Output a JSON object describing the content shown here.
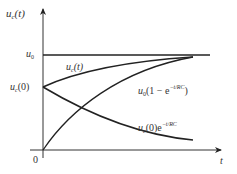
{
  "diagram": {
    "type": "waveform-plot",
    "colors": {
      "axis": "#333333",
      "curve": "#222222",
      "text": "#333333"
    },
    "axes": {
      "y_label": "u",
      "y_label_sub": "c",
      "y_label_arg": "(t)",
      "x_label": "t",
      "origin_label": "0"
    },
    "levels": {
      "u0_main": "u",
      "u0_sub": "0",
      "uc0_main": "u",
      "uc0_sub": "c",
      "uc0_arg": "(0)"
    },
    "curves": [
      {
        "id": "uc_t",
        "label_main": "u",
        "label_sub": "c",
        "label_rest": "(t)"
      },
      {
        "id": "charge",
        "label_main": "u",
        "label_sub": "0",
        "label_rest": "(1 − e",
        "label_exp": "−t/RC",
        "label_close": ")"
      },
      {
        "id": "discharge",
        "label_main": "u",
        "label_sub": "c",
        "label_rest": "(0)e",
        "label_exp": "−t/RC"
      }
    ]
  }
}
